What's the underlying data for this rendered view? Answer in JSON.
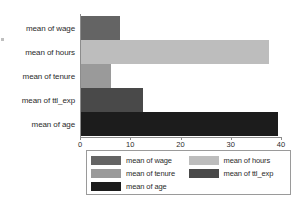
{
  "chart_data": {
    "type": "bar",
    "orientation": "horizontal",
    "title": "",
    "subtitle": "",
    "xlabel": "",
    "ylabel": "",
    "categories": [
      "mean of wage",
      "mean of hours",
      "mean of tenure",
      "mean of ttl_exp",
      "mean of age"
    ],
    "values": [
      7.8,
      37.5,
      6.0,
      12.4,
      39.3
    ],
    "xlim": [
      0,
      40
    ],
    "xticks": [
      0,
      10,
      20,
      30,
      40
    ],
    "xtick_labels": [
      "0",
      "10",
      "20",
      "30",
      "40"
    ],
    "grid": false,
    "legend_position": "bottom",
    "series": [
      {
        "name": "mean of wage",
        "value": 7.8,
        "color": "#646464"
      },
      {
        "name": "mean of hours",
        "value": 37.5,
        "color": "#bdbdbd"
      },
      {
        "name": "mean of tenure",
        "value": 6.0,
        "color": "#9a9a9a"
      },
      {
        "name": "mean of ttl_exp",
        "value": 12.4,
        "color": "#494949"
      },
      {
        "name": "mean of age",
        "value": 39.3,
        "color": "#1c1c1c"
      }
    ]
  },
  "legend": {
    "items": [
      {
        "label": "mean of wage",
        "color": "#646464"
      },
      {
        "label": "mean of hours",
        "color": "#bdbdbd"
      },
      {
        "label": "mean of tenure",
        "color": "#9a9a9a"
      },
      {
        "label": "mean of ttl_exp",
        "color": "#494949"
      },
      {
        "label": "mean of age",
        "color": "#1c1c1c"
      }
    ]
  },
  "colors": {
    "axis": "#8c8c8c",
    "text": "#2b2b2b",
    "background": "#ffffff",
    "legend_border": "#9a9a9a"
  }
}
